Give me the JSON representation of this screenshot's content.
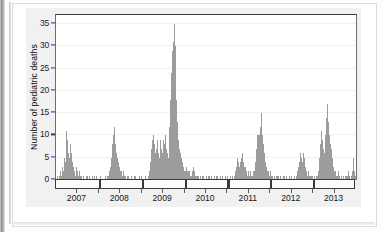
{
  "figure": {
    "background_color": "#f1f1f1",
    "plot_background": "#ffffff",
    "bar_color": "#9c9c9c",
    "axis_color": "#3a3a3a"
  },
  "chart_data": {
    "type": "bar",
    "title": "",
    "xlabel": "",
    "ylabel": "Number of pediatric deaths",
    "ylim": [
      0,
      37
    ],
    "yticks": [
      0,
      5,
      10,
      15,
      20,
      25,
      30,
      35
    ],
    "ytick_labels": [
      "0",
      "5",
      "10",
      "15",
      "20",
      "25",
      "30",
      "35"
    ],
    "grid": true,
    "legend": "none",
    "x_tick_labels": [
      "2007",
      "2008",
      "2009",
      "2010",
      "2011",
      "2012",
      "2013"
    ],
    "x_tick_positions": [
      0.5,
      1.5,
      2.5,
      3.5,
      4.5,
      5.5,
      6.5
    ],
    "season_boundaries": [
      1.0,
      2.0,
      3.0,
      4.0,
      5.0,
      6.0
    ],
    "x_range": [
      0,
      7
    ],
    "x_unit": "week",
    "series_name": "Weekly pediatric influenza-associated deaths",
    "x_axis_note": "Each season band spans one influenza season; labels are centered on the year",
    "values": [
      0,
      1,
      0,
      1,
      0,
      2,
      1,
      3,
      2,
      5,
      4,
      8,
      11,
      9,
      6,
      5,
      8,
      6,
      4,
      3,
      2,
      2,
      1,
      3,
      2,
      1,
      2,
      1,
      0,
      1,
      0,
      1,
      0,
      0,
      1,
      0,
      1,
      0,
      1,
      0,
      0,
      1,
      0,
      0,
      1,
      0,
      1,
      0,
      0,
      0,
      1,
      0,
      0,
      0,
      0,
      0,
      1,
      0,
      0,
      1,
      1,
      2,
      3,
      5,
      8,
      10,
      12,
      9,
      8,
      6,
      5,
      4,
      3,
      2,
      2,
      1,
      1,
      2,
      1,
      1,
      0,
      1,
      0,
      1,
      0,
      0,
      1,
      0,
      0,
      1,
      0,
      1,
      0,
      0,
      0,
      1,
      0,
      0,
      1,
      0,
      0,
      0,
      1,
      0,
      0,
      1,
      1,
      2,
      4,
      7,
      9,
      10,
      8,
      6,
      5,
      7,
      9,
      6,
      5,
      9,
      7,
      5,
      6,
      9,
      8,
      10,
      7,
      6,
      5,
      8,
      12,
      18,
      24,
      29,
      31,
      35,
      30,
      24,
      18,
      13,
      9,
      7,
      6,
      5,
      4,
      3,
      3,
      2,
      2,
      3,
      2,
      2,
      1,
      2,
      1,
      1,
      2,
      3,
      2,
      1,
      1,
      0,
      1,
      1,
      0,
      1,
      0,
      1,
      0,
      1,
      0,
      0,
      1,
      0,
      1,
      0,
      1,
      0,
      1,
      0,
      0,
      1,
      0,
      1,
      0,
      1,
      0,
      0,
      1,
      0,
      1,
      0,
      0,
      0,
      1,
      0,
      1,
      0,
      0,
      1,
      0,
      0,
      1,
      0,
      1,
      2,
      3,
      4,
      5,
      4,
      3,
      4,
      5,
      6,
      4,
      3,
      2,
      3,
      2,
      1,
      2,
      1,
      2,
      1,
      1,
      1,
      2,
      2,
      4,
      7,
      10,
      10,
      10,
      10,
      12,
      15,
      10,
      8,
      6,
      5,
      4,
      3,
      2,
      2,
      1,
      2,
      1,
      1,
      1,
      0,
      1,
      0,
      1,
      1,
      0,
      1,
      0,
      1,
      0,
      0,
      1,
      0,
      1,
      0,
      1,
      0,
      0,
      1,
      0,
      0,
      1,
      0,
      0,
      1,
      0,
      1,
      2,
      2,
      3,
      4,
      6,
      5,
      4,
      6,
      5,
      3,
      2,
      2,
      1,
      2,
      1,
      1,
      1,
      0,
      1,
      0,
      1,
      0,
      1,
      1,
      2,
      3,
      5,
      8,
      11,
      9,
      7,
      6,
      8,
      10,
      14,
      17,
      13,
      10,
      8,
      7,
      5,
      4,
      3,
      2,
      2,
      1,
      1,
      2,
      1,
      1,
      0,
      1,
      0,
      1,
      0,
      1,
      0,
      1,
      1,
      2,
      1,
      0,
      1,
      2,
      3,
      5,
      2,
      1
    ]
  }
}
